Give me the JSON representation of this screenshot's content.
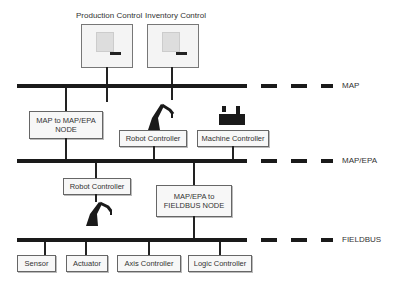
{
  "networks": {
    "map": {
      "label": "MAP"
    },
    "map_epa": {
      "label": "MAP/EPA"
    },
    "fieldbus": {
      "label": "FIELDBUS"
    }
  },
  "top_terminals": [
    {
      "label": "Production Control"
    },
    {
      "label": "Inventory Control"
    }
  ],
  "map_level": {
    "gateway": {
      "line1": "MAP to MAP/EPA",
      "line2": "NODE"
    },
    "robot_controller": {
      "label": "Robot Controller"
    },
    "machine_controller": {
      "label": "Machine Controller"
    }
  },
  "map_epa_level": {
    "robot_controller": {
      "label": "Robot Controller"
    },
    "gateway": {
      "line1": "MAP/EPA to",
      "line2": "FIELDBUS NODE"
    }
  },
  "fieldbus_level": {
    "devices": [
      {
        "label": "Sensor"
      },
      {
        "label": "Actuator"
      },
      {
        "label": "Axis Controller"
      },
      {
        "label": "Logic Controller"
      }
    ]
  }
}
